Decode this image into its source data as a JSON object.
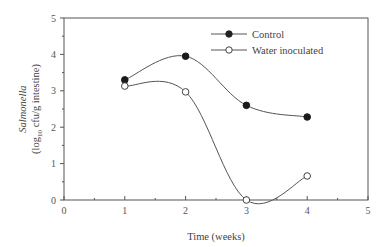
{
  "chart_data": {
    "type": "line",
    "title": "",
    "xlabel": "Time (weeks)",
    "ylabel_line1": "Salmonella",
    "ylabel_line2": "(log10 cfu/g intestine)",
    "xlim": [
      0,
      5
    ],
    "ylim": [
      0,
      5
    ],
    "xticks": [
      "0",
      "1",
      "2",
      "3",
      "4",
      "5"
    ],
    "yticks": [
      "0",
      "1",
      "2",
      "3",
      "4",
      "5"
    ],
    "grid": false,
    "legend_position": "upper right",
    "x": [
      1,
      2,
      3,
      4
    ],
    "series": [
      {
        "name": "Control",
        "marker": "filled-circle",
        "values": [
          3.3,
          3.95,
          2.6,
          2.28
        ]
      },
      {
        "name": "Water inoculated",
        "marker": "open-circle",
        "values": [
          3.13,
          2.97,
          0.0,
          0.66
        ]
      }
    ]
  }
}
